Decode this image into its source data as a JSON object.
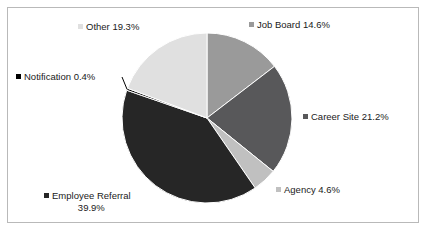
{
  "chart_data": {
    "type": "pie",
    "title": "",
    "categories": [
      "Job Board",
      "Career Site",
      "Agency",
      "Employee Referral",
      "Notification",
      "Other"
    ],
    "values": [
      14.6,
      21.2,
      4.6,
      39.9,
      0.4,
      19.3
    ],
    "unit": "%",
    "start_angle_deg": 0,
    "direction": "clockwise",
    "legend": "none",
    "grid": false,
    "slice_colors": [
      "#9a9a9a",
      "#58585a",
      "#c0c0c0",
      "#262626",
      "#000000",
      "#e0e0e0"
    ],
    "labels": [
      {
        "name": "Job Board",
        "value": 14.6,
        "text": "Job Board 14.6%",
        "marker_color": "#9a9a9a",
        "leader_line": false
      },
      {
        "name": "Career Site",
        "value": 21.2,
        "text": "Career Site 21.2%",
        "marker_color": "#58585a",
        "leader_line": false
      },
      {
        "name": "Agency",
        "value": 4.6,
        "text": "Agency 4.6%",
        "marker_color": "#c0c0c0",
        "leader_line": false
      },
      {
        "name": "Employee Referral",
        "value": 39.9,
        "text": "Employee Referral",
        "text_line2": "39.9%",
        "marker_color": "#262626",
        "leader_line": false
      },
      {
        "name": "Notification",
        "value": 0.4,
        "text": "Notification 0.4%",
        "marker_color": "#000000",
        "leader_line": true
      },
      {
        "name": "Other",
        "value": 19.3,
        "text": "Other 19.3%",
        "marker_color": "#e0e0e0",
        "leader_line": false
      }
    ]
  },
  "geometry": {
    "center_x": 207,
    "center_y": 118,
    "radius": 85
  },
  "style": {
    "background": "#ffffff",
    "border_color": "#b9b9b9",
    "text_color": "#1a1a1a",
    "slice_stroke": "#ffffff"
  }
}
